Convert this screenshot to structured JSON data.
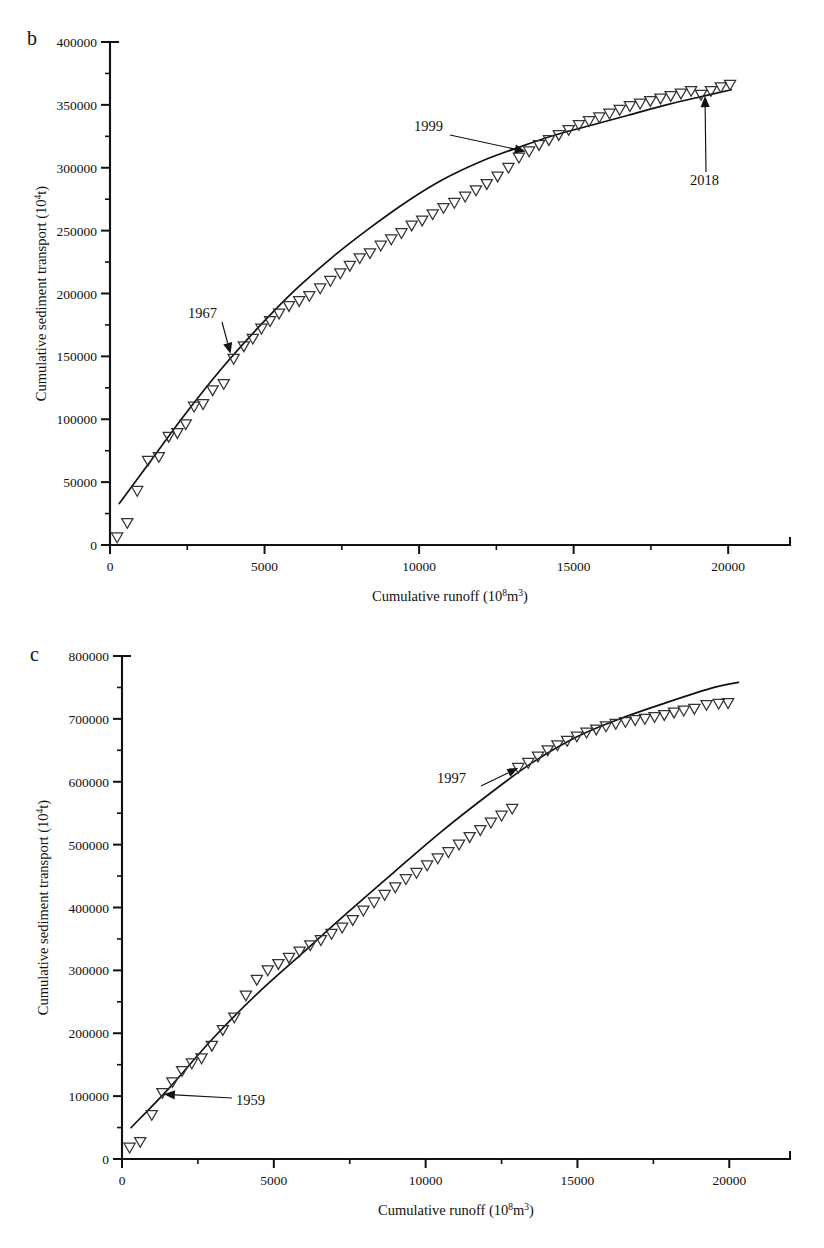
{
  "figure": {
    "background": "#ffffff",
    "foreground": "#111111",
    "marker_style": "open-down-triangle",
    "panels": [
      "b",
      "c"
    ]
  },
  "panel_b": {
    "letter": "b",
    "xlabel_main": "Cumulative runoff (10",
    "xlabel_sup": "8",
    "xlabel_tail": "m",
    "xlabel_sup2": "3",
    "xlabel_close": ")",
    "ylabel_main": "Cumulative sediment transport (10",
    "ylabel_sup": "4",
    "ylabel_close": "t)",
    "annotations": [
      {
        "name": "1967",
        "label": "1967"
      },
      {
        "name": "1999",
        "label": "1999"
      },
      {
        "name": "2018",
        "label": "2018"
      }
    ]
  },
  "panel_c": {
    "letter": "c",
    "xlabel_main": "Cumulative runoff (10",
    "xlabel_sup": "8",
    "xlabel_tail": "m",
    "xlabel_sup2": "3",
    "xlabel_close": ")",
    "ylabel_main": "Cumulative sediment transport (10",
    "ylabel_sup": "4",
    "ylabel_close": "t)",
    "annotations": [
      {
        "name": "1959",
        "label": "1959"
      },
      {
        "name": "1997",
        "label": "1997"
      }
    ]
  },
  "chart_data": [
    {
      "id": "panel_b",
      "type": "scatter",
      "title": "b",
      "xlabel": "Cumulative runoff (10^8 m^3)",
      "ylabel": "Cumulative sediment transport (10^4 t)",
      "xlim": [
        0,
        22000
      ],
      "ylim": [
        0,
        400000
      ],
      "xticks": [
        0,
        5000,
        10000,
        15000,
        20000
      ],
      "xticklabels": [
        "0",
        "5000",
        "10000",
        "15000",
        "20000"
      ],
      "yticks": [
        0,
        50000,
        100000,
        150000,
        200000,
        250000,
        300000,
        350000,
        400000
      ],
      "yticklabels": [
        "0",
        "50000",
        "100000",
        "150000",
        "200000",
        "250000",
        "300000",
        "350000",
        "400000"
      ],
      "x_minor_interval": 2500,
      "y_minor_interval": 25000,
      "grid": false,
      "legend": false,
      "series": [
        {
          "name": "Cumulative sediment vs cumulative runoff",
          "marker": "open-down-triangle",
          "x": [
            230,
            560,
            880,
            1230,
            1580,
            1900,
            2180,
            2450,
            2720,
            3010,
            3320,
            3680,
            4000,
            4330,
            4620,
            4900,
            5180,
            5470,
            5790,
            6120,
            6450,
            6800,
            7130,
            7450,
            7760,
            8080,
            8410,
            8760,
            9100,
            9430,
            9760,
            10100,
            10440,
            10790,
            11140,
            11490,
            11840,
            12190,
            12540,
            12890,
            13230,
            13560,
            13880,
            14200,
            14520,
            14840,
            15170,
            15500,
            15830,
            16160,
            16490,
            16820,
            17150,
            17480,
            17810,
            18140,
            18470,
            18800,
            19120,
            19440,
            19760,
            20060
          ],
          "y": [
            6000,
            17500,
            43000,
            67000,
            70000,
            86000,
            89000,
            96000,
            110000,
            112000,
            123000,
            128000,
            148000,
            158000,
            164000,
            172000,
            178000,
            184000,
            190000,
            194000,
            198000,
            204000,
            210000,
            216000,
            222000,
            228000,
            232000,
            238000,
            243000,
            248000,
            254000,
            258000,
            263000,
            268000,
            272000,
            277000,
            282000,
            287000,
            293000,
            300000,
            308000,
            313000,
            318000,
            322000,
            326000,
            330000,
            334000,
            337000,
            340000,
            343000,
            346000,
            349000,
            351000,
            353000,
            355000,
            357000,
            359000,
            361000,
            358000,
            361000,
            364000,
            366000
          ]
        }
      ],
      "fit_curve": {
        "name": "fitted trend",
        "x": [
          300,
          1200,
          2400,
          3600,
          4800,
          6000,
          7200,
          8400,
          9600,
          10800,
          12000,
          13200,
          14400,
          15600,
          16800,
          18000,
          19200,
          20100
        ],
        "y": [
          33000,
          63000,
          103000,
          140000,
          173000,
          203000,
          229000,
          252000,
          273000,
          291000,
          305000,
          316000,
          326000,
          334000,
          342000,
          350000,
          357000,
          362000
        ]
      },
      "annotations": [
        {
          "text": "1967",
          "point_x": 3900,
          "point_y": 152000
        },
        {
          "text": "1999",
          "point_x": 13450,
          "point_y": 313000
        },
        {
          "text": "2018",
          "point_x": 19250,
          "point_y": 357000
        }
      ]
    },
    {
      "id": "panel_c",
      "type": "scatter",
      "title": "c",
      "xlabel": "Cumulative runoff (10^8 m^3)",
      "ylabel": "Cumulative sediment transport (10^4 t)",
      "xlim": [
        0,
        22000
      ],
      "ylim": [
        0,
        800000
      ],
      "xticks": [
        0,
        5000,
        10000,
        15000,
        20000
      ],
      "xticklabels": [
        "0",
        "5000",
        "10000",
        "15000",
        "20000"
      ],
      "yticks": [
        0,
        100000,
        200000,
        300000,
        400000,
        500000,
        600000,
        700000,
        800000
      ],
      "yticklabels": [
        "0",
        "100000",
        "200000",
        "300000",
        "400000",
        "500000",
        "600000",
        "700000",
        "800000"
      ],
      "x_minor_interval": 2500,
      "y_minor_interval": 50000,
      "grid": false,
      "legend": false,
      "series": [
        {
          "name": "Cumulative sediment vs cumulative runoff",
          "marker": "open-down-triangle",
          "x": [
            250,
            600,
            980,
            1330,
            1660,
            1980,
            2300,
            2620,
            2960,
            3320,
            3700,
            4080,
            4440,
            4800,
            5150,
            5500,
            5850,
            6200,
            6550,
            6900,
            7250,
            7600,
            7950,
            8300,
            8650,
            9000,
            9350,
            9700,
            10050,
            10400,
            10750,
            11100,
            11450,
            11800,
            12150,
            12500,
            12850,
            13050,
            13380,
            13700,
            14020,
            14340,
            14660,
            14980,
            15300,
            15620,
            15940,
            16260,
            16580,
            16900,
            17220,
            17540,
            17860,
            18180,
            18500,
            18850,
            19250,
            19650,
            19960
          ],
          "y": [
            18000,
            27000,
            70000,
            105000,
            122000,
            140000,
            152000,
            160000,
            180000,
            205000,
            225000,
            260000,
            285000,
            300000,
            310000,
            320000,
            330000,
            340000,
            348000,
            358000,
            368000,
            380000,
            395000,
            408000,
            420000,
            432000,
            445000,
            455000,
            467000,
            478000,
            488000,
            500000,
            512000,
            523000,
            535000,
            546000,
            557000,
            622000,
            630000,
            640000,
            650000,
            658000,
            665000,
            672000,
            678000,
            683000,
            688000,
            692000,
            695000,
            698000,
            700000,
            703000,
            706000,
            710000,
            713000,
            716000,
            722000,
            724000,
            725000
          ]
        }
      ],
      "fit_curve": {
        "name": "fitted trend",
        "x": [
          300,
          1500,
          3000,
          4500,
          6000,
          7500,
          9000,
          10500,
          12000,
          13500,
          15000,
          16500,
          18000,
          19500,
          20300
        ],
        "y": [
          50000,
          110000,
          192000,
          265000,
          330000,
          395000,
          458000,
          520000,
          577000,
          630000,
          672000,
          702000,
          727000,
          750000,
          758000
        ]
      },
      "annotations": [
        {
          "text": "1959",
          "point_x": 1380,
          "point_y": 103000
        },
        {
          "text": "1997",
          "point_x": 13050,
          "point_y": 622000
        }
      ]
    }
  ]
}
